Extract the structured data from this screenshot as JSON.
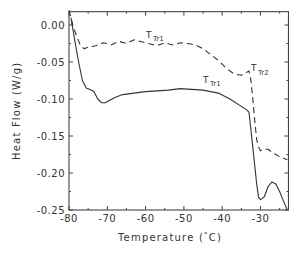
{
  "chart_data": {
    "type": "line",
    "title": "",
    "xlabel": "Temperature (°C)",
    "ylabel": "Heat Flow (W/g)",
    "xlim": [
      -80,
      -22.7
    ],
    "ylim": [
      -0.25,
      0.018
    ],
    "grid": false,
    "legend": null,
    "x_ticks": [
      -80,
      -70,
      -60,
      -50,
      -40,
      -30
    ],
    "x_tick_labels": [
      "-80",
      "-70",
      "-60",
      "-50",
      "-40",
      "-30"
    ],
    "y_ticks": [
      0.0,
      -0.05,
      -0.1,
      -0.15,
      -0.2,
      -0.25
    ],
    "y_tick_labels": [
      "0.00",
      "-0.05",
      "-0.10",
      "-0.15",
      "-0.20",
      "-0.25"
    ],
    "series": [
      {
        "name": "solid curve",
        "style": "solid",
        "x": [
          -79.5,
          -78.5,
          -77.5,
          -76.5,
          -75.5,
          -74.5,
          -73.5,
          -72.5,
          -71.5,
          -70.5,
          -69.5,
          -68,
          -66,
          -63,
          -60,
          -57,
          -54,
          -51,
          -48,
          -45,
          -43,
          -41,
          -38,
          -35,
          -33.5,
          -33,
          -32,
          -31,
          -30.5,
          -30,
          -29,
          -28,
          -27,
          -26,
          -25,
          -24,
          -23
        ],
        "values": [
          0.01,
          -0.02,
          -0.05,
          -0.075,
          -0.085,
          -0.087,
          -0.09,
          -0.1,
          -0.105,
          -0.105,
          -0.102,
          -0.098,
          -0.094,
          -0.092,
          -0.09,
          -0.089,
          -0.088,
          -0.086,
          -0.087,
          -0.088,
          -0.09,
          -0.092,
          -0.1,
          -0.11,
          -0.115,
          -0.118,
          -0.165,
          -0.215,
          -0.233,
          -0.236,
          -0.232,
          -0.218,
          -0.212,
          -0.215,
          -0.225,
          -0.238,
          -0.25
        ]
      },
      {
        "name": "dashed curve",
        "style": "dashed",
        "x": [
          -80,
          -79,
          -78,
          -77,
          -76,
          -75,
          -73,
          -71,
          -69,
          -67,
          -65,
          -63,
          -60,
          -57,
          -55,
          -53,
          -51,
          -49,
          -47,
          -45,
          -43,
          -41,
          -39,
          -37,
          -35,
          -34,
          -33,
          -32.5,
          -32,
          -31.5,
          -31,
          -30.5,
          -30,
          -29,
          -28,
          -27,
          -26,
          -25,
          -24,
          -23
        ],
        "values": [
          0.02,
          0.0,
          -0.015,
          -0.028,
          -0.032,
          -0.03,
          -0.028,
          -0.024,
          -0.027,
          -0.022,
          -0.025,
          -0.02,
          -0.024,
          -0.028,
          -0.024,
          -0.027,
          -0.024,
          -0.025,
          -0.027,
          -0.032,
          -0.04,
          -0.048,
          -0.058,
          -0.066,
          -0.068,
          -0.065,
          -0.062,
          -0.075,
          -0.1,
          -0.13,
          -0.155,
          -0.165,
          -0.17,
          -0.168,
          -0.168,
          -0.172,
          -0.175,
          -0.178,
          -0.18,
          -0.182
        ]
      }
    ],
    "annotations": [
      {
        "text": "T",
        "sub": "Tr1",
        "x": -52,
        "y": 0.008,
        "target": "dashed curve"
      },
      {
        "text": "T",
        "sub": "Tr1",
        "x": -46,
        "y": -0.08,
        "target": "solid curve"
      },
      {
        "text": "T",
        "sub": "Tr2",
        "x": -30,
        "y": -0.053,
        "target": "dashed curve"
      }
    ]
  },
  "render": {
    "x_label": "Temperature (",
    "x_label_degree": "°",
    "x_label_unit": "C)",
    "y_label": "Heat Flow (W/g)",
    "anno_main": "T",
    "anno_tr1": "Tr1",
    "anno_tr2": "Tr2"
  }
}
